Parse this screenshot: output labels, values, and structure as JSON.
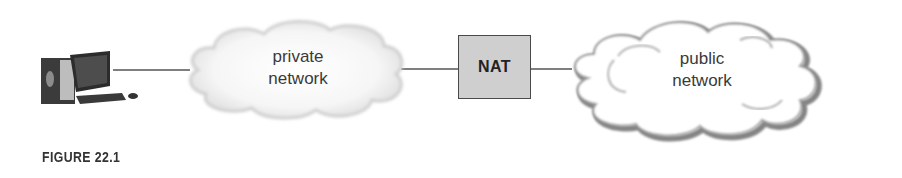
{
  "diagram": {
    "nodes": {
      "computer": {
        "label": "",
        "icon": "desktop-computer-icon"
      },
      "private_network": {
        "label_line1": "private",
        "label_line2": "network"
      },
      "nat": {
        "label": "NAT"
      },
      "public_network": {
        "label_line1": "public",
        "label_line2": "network"
      }
    },
    "edges": [
      {
        "from": "computer",
        "to": "private_network"
      },
      {
        "from": "private_network",
        "to": "nat"
      },
      {
        "from": "nat",
        "to": "public_network"
      }
    ],
    "colors": {
      "line": "#555555",
      "nat_fill": "#cfcfcf",
      "nat_border": "#4a4a4a",
      "private_cloud_fill": "#eeeeee",
      "public_cloud_outline": "#8a8a8a"
    }
  },
  "caption": "FIGURE 22.1"
}
